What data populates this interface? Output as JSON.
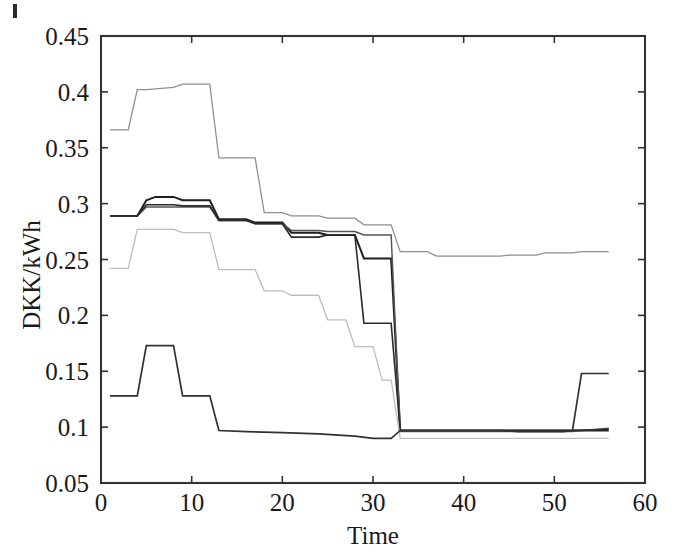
{
  "figure": {
    "background_color": "#ffffff",
    "frame_color": "#333333",
    "artifact_name": "scan-edge-mark"
  },
  "chart_data": {
    "type": "line",
    "title": "",
    "subtitle": "",
    "xlabel": "Time",
    "ylabel": "DKK/kWh",
    "xlim": [
      0,
      60
    ],
    "ylim": [
      0.05,
      0.45
    ],
    "xticks": [
      0,
      10,
      20,
      30,
      40,
      50,
      60
    ],
    "xtick_labels": [
      "0",
      "10",
      "20",
      "30",
      "40",
      "50",
      "60"
    ],
    "yticks": [
      0.05,
      0.1,
      0.15,
      0.2,
      0.25,
      0.3,
      0.35,
      0.4,
      0.45
    ],
    "ytick_labels": [
      "0.05",
      "0.1",
      "0.15",
      "0.2",
      "0.25",
      "0.3",
      "0.35",
      "0.4",
      "0.45"
    ],
    "grid": false,
    "legend": "none",
    "legend_position": "none",
    "annotations": [],
    "series": [
      {
        "name": "series-1-upper",
        "color": "#8f8f8f",
        "width": 1.3,
        "x": [
          1,
          3,
          4,
          5,
          8,
          9,
          11,
          12,
          13,
          16,
          17,
          18,
          20,
          21,
          24,
          25,
          28,
          29,
          32,
          33,
          36,
          37,
          40,
          44,
          45,
          48,
          49,
          52,
          53,
          56
        ],
        "y": [
          0.366,
          0.366,
          0.402,
          0.402,
          0.404,
          0.407,
          0.407,
          0.407,
          0.341,
          0.341,
          0.341,
          0.292,
          0.292,
          0.289,
          0.289,
          0.287,
          0.287,
          0.281,
          0.281,
          0.257,
          0.257,
          0.253,
          0.253,
          0.253,
          0.254,
          0.254,
          0.256,
          0.256,
          0.257,
          0.257
        ]
      },
      {
        "name": "series-2-dark-top",
        "color": "#1f1f1f",
        "width": 2.0,
        "x": [
          1,
          4,
          5,
          6,
          8,
          9,
          11,
          12,
          13,
          16,
          17,
          20,
          21,
          24,
          25,
          28,
          29,
          31,
          32,
          33,
          36,
          40,
          44,
          48,
          52,
          56
        ],
        "y": [
          0.289,
          0.289,
          0.303,
          0.306,
          0.306,
          0.303,
          0.303,
          0.303,
          0.286,
          0.286,
          0.283,
          0.283,
          0.274,
          0.274,
          0.272,
          0.272,
          0.251,
          0.251,
          0.251,
          0.097,
          0.097,
          0.097,
          0.097,
          0.097,
          0.097,
          0.097
        ]
      },
      {
        "name": "series-3-mid-gray",
        "color": "#555555",
        "width": 1.5,
        "x": [
          1,
          4,
          5,
          8,
          9,
          11,
          12,
          13,
          16,
          17,
          20,
          21,
          24,
          25,
          28,
          29,
          31,
          32,
          33,
          36,
          40,
          44,
          48,
          52,
          56
        ],
        "y": [
          0.289,
          0.289,
          0.297,
          0.297,
          0.297,
          0.297,
          0.297,
          0.285,
          0.285,
          0.282,
          0.282,
          0.276,
          0.276,
          0.275,
          0.275,
          0.272,
          0.272,
          0.272,
          0.096,
          0.096,
          0.096,
          0.096,
          0.096,
          0.096,
          0.099
        ]
      },
      {
        "name": "series-4-dark-step",
        "color": "#2b2b2b",
        "width": 1.6,
        "x": [
          1,
          4,
          5,
          8,
          9,
          12,
          13,
          16,
          17,
          20,
          21,
          24,
          25,
          28,
          29,
          32,
          33,
          36,
          40,
          44,
          48,
          52,
          56
        ],
        "y": [
          0.289,
          0.289,
          0.299,
          0.299,
          0.298,
          0.298,
          0.285,
          0.285,
          0.282,
          0.282,
          0.27,
          0.27,
          0.272,
          0.272,
          0.193,
          0.193,
          0.097,
          0.097,
          0.097,
          0.097,
          0.097,
          0.097,
          0.098
        ]
      },
      {
        "name": "series-5-light-band",
        "color": "#bdbdbd",
        "width": 1.3,
        "x": [
          1,
          3,
          4,
          5,
          8,
          9,
          11,
          12,
          13,
          16,
          17,
          18,
          20,
          21,
          24,
          25,
          27,
          28,
          30,
          31,
          32,
          33,
          36,
          40,
          44,
          48,
          52,
          56
        ],
        "y": [
          0.242,
          0.242,
          0.277,
          0.277,
          0.277,
          0.274,
          0.274,
          0.274,
          0.241,
          0.241,
          0.241,
          0.222,
          0.222,
          0.218,
          0.218,
          0.196,
          0.196,
          0.172,
          0.172,
          0.142,
          0.142,
          0.09,
          0.09,
          0.09,
          0.09,
          0.09,
          0.09,
          0.09
        ]
      },
      {
        "name": "series-6-lower-dark",
        "color": "#303030",
        "width": 1.7,
        "x": [
          1,
          4,
          5,
          8,
          9,
          12,
          13,
          16,
          20,
          24,
          28,
          30,
          31,
          32,
          33,
          36,
          40,
          44,
          46,
          48,
          50,
          51,
          52,
          53,
          56
        ],
        "y": [
          0.128,
          0.128,
          0.173,
          0.173,
          0.128,
          0.128,
          0.097,
          0.096,
          0.095,
          0.094,
          0.092,
          0.09,
          0.09,
          0.09,
          0.097,
          0.097,
          0.097,
          0.097,
          0.096,
          0.096,
          0.096,
          0.096,
          0.097,
          0.148,
          0.148
        ]
      }
    ]
  }
}
